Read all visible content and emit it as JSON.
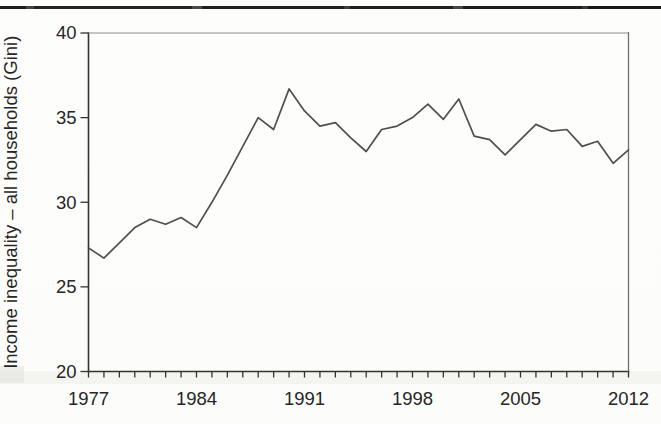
{
  "chart_data": {
    "type": "line",
    "title": "",
    "xlabel": "",
    "ylabel": "Income inequality – all households (Gini)",
    "x": [
      1977,
      1978,
      1979,
      1980,
      1981,
      1982,
      1983,
      1984,
      1985,
      1986,
      1987,
      1988,
      1989,
      1990,
      1991,
      1992,
      1993,
      1994,
      1995,
      1996,
      1997,
      1998,
      1999,
      2000,
      2001,
      2002,
      2003,
      2004,
      2005,
      2006,
      2007,
      2008,
      2009,
      2010,
      2011,
      2012
    ],
    "values": [
      27.3,
      26.7,
      27.6,
      28.5,
      29.0,
      28.7,
      29.1,
      28.5,
      30.0,
      31.6,
      33.3,
      35.0,
      34.3,
      36.7,
      35.4,
      34.5,
      34.7,
      33.8,
      33.0,
      34.3,
      34.5,
      35.0,
      35.8,
      34.9,
      36.1,
      33.9,
      33.7,
      32.8,
      33.7,
      34.6,
      34.2,
      34.3,
      33.3,
      33.6,
      32.3,
      33.1
    ],
    "xlim": [
      1977,
      2012
    ],
    "ylim": [
      20,
      40
    ],
    "xticks_labeled": [
      1977,
      1984,
      1991,
      1998,
      2005,
      2012
    ],
    "yticks": [
      20,
      25,
      30,
      35,
      40
    ],
    "grid": false,
    "legend": "none",
    "line_color": "#4f4f4f"
  },
  "colors": {
    "axis_ink": "#333333",
    "frame_top": "#8d8d8d",
    "frame_right": "#6e6e6e",
    "text_ink": "#262626",
    "page_rule": "#1e1e1e"
  }
}
